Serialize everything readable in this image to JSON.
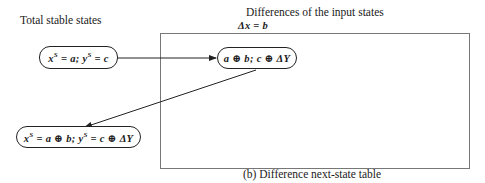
{
  "labels": {
    "left_heading": "Total stable states",
    "top_heading": "Differences of the input states",
    "top_subheading": "Δx = b",
    "caption": "(b) Difference next-state table"
  },
  "nodes": [
    {
      "id": "current-state",
      "x_var": "x",
      "x_sup": "S",
      "x_val": "= a; ",
      "y_var": "y",
      "y_sup": "S",
      "y_val": "= c"
    },
    {
      "id": "difference-entry",
      "text": "a ⊕ b; c ⊕ ΔY"
    },
    {
      "id": "next-state",
      "x_var": "x",
      "x_sup": "S",
      "x_val": "= a ⊕ b; ",
      "y_var": "y",
      "y_sup": "S",
      "y_val": "= c ⊕ ΔY"
    }
  ],
  "edges": [
    {
      "from": "current-state",
      "to": "difference-entry"
    },
    {
      "from": "difference-entry",
      "to": "next-state"
    }
  ],
  "colors": {
    "stroke": "#222222",
    "table_border": "#777777"
  }
}
